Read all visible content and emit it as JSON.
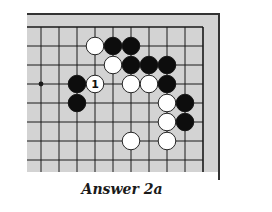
{
  "diagram": {
    "type": "go-board-corner",
    "caption": "Answer 2a",
    "colors": {
      "board": "#d3d3d3",
      "line": "#1a1a1a",
      "border": "#333333",
      "black_stone": "#0d0d0d",
      "white_stone": "#ffffff"
    },
    "grid": {
      "columns": 10,
      "rows": 8,
      "origin_x": 41,
      "origin_y": 27,
      "step_x": 18,
      "step_y": 19
    },
    "star_points": [
      {
        "col": 0,
        "row": 3
      }
    ],
    "stones": [
      {
        "color": "white",
        "col": 3,
        "row": 1
      },
      {
        "color": "black",
        "col": 4,
        "row": 1
      },
      {
        "color": "black",
        "col": 5,
        "row": 1
      },
      {
        "color": "white",
        "col": 4,
        "row": 2
      },
      {
        "color": "black",
        "col": 5,
        "row": 2
      },
      {
        "color": "black",
        "col": 6,
        "row": 2
      },
      {
        "color": "black",
        "col": 7,
        "row": 2
      },
      {
        "color": "black",
        "col": 2,
        "row": 3
      },
      {
        "color": "white",
        "col": 3,
        "row": 3,
        "label": "1"
      },
      {
        "color": "white",
        "col": 5,
        "row": 3
      },
      {
        "color": "white",
        "col": 6,
        "row": 3
      },
      {
        "color": "black",
        "col": 7,
        "row": 3
      },
      {
        "color": "black",
        "col": 2,
        "row": 4
      },
      {
        "color": "white",
        "col": 7,
        "row": 4
      },
      {
        "color": "black",
        "col": 8,
        "row": 4
      },
      {
        "color": "white",
        "col": 7,
        "row": 5
      },
      {
        "color": "black",
        "col": 8,
        "row": 5
      },
      {
        "color": "white",
        "col": 5,
        "row": 6
      },
      {
        "color": "white",
        "col": 7,
        "row": 6
      }
    ]
  }
}
